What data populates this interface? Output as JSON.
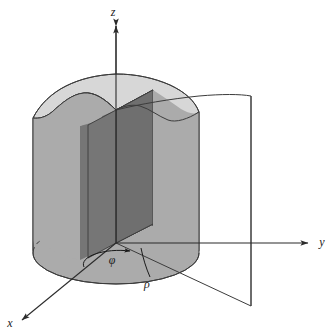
{
  "figure": {
    "background_color": "#ffffff"
  },
  "axes": {
    "z": {
      "label": "z",
      "label_x": 113,
      "label_y": 16,
      "name": "z-axis"
    },
    "y": {
      "label": "y",
      "label_x": 322,
      "label_y": 243,
      "name": "y-axis"
    },
    "x": {
      "label": "x",
      "label_x": 10,
      "label_y": 327,
      "name": "x-axis"
    }
  },
  "annotations": {
    "phi": {
      "label": "φ",
      "label_x": 112,
      "label_y": 264,
      "name": "azimuthal-angle-phi"
    },
    "rho": {
      "label": "ρ",
      "label_x": 146,
      "label_y": 285,
      "name": "radial-distance-rho"
    }
  },
  "colors": {
    "stroke": "#3c3c3c",
    "axis_stroke": "#2b2b2b",
    "cylinder_side": "#ababab",
    "cylinder_side_front": "#b0b0b0",
    "cylinder_cut_dark": "#6f6f6f",
    "cylinder_cut_darker": "#787878",
    "top_cap_light": "#d7d7d7",
    "top_cap_edge": "#c9c9c9",
    "base_fill": "#ababab",
    "halfplane_fill": "#ffffff",
    "label_color": "#1a1a1a"
  },
  "geometry": {
    "origin": {
      "x": 116,
      "y": 243
    },
    "cylinder": {
      "radius_x": 83,
      "radius_y": 31,
      "center_base_x": 116,
      "center_base_y": 253,
      "top_y_min": 57,
      "top_y_max": 112
    },
    "halfplane": {
      "near_edge_x": 116,
      "far_edge_x": 251,
      "top_y": 96,
      "bottom_y": 306
    }
  },
  "elements": [
    {
      "name": "cylinder-body",
      "description": "Vertical circular cylinder with irregular wavy top"
    },
    {
      "name": "cylinder-top-cap",
      "description": "Light gray irregular top surface"
    },
    {
      "name": "cylinder-cut-wedge",
      "description": "Dark gray cut-away wedge faces"
    },
    {
      "name": "cylinder-base-ellipse",
      "description": "Base disk in the xy-plane"
    },
    {
      "name": "base-hidden-arc",
      "description": "Dashed hidden rear arc of the base circle"
    },
    {
      "name": "halfplane",
      "description": "Vertical half-plane at constant phi"
    },
    {
      "name": "phi-arc",
      "description": "Arc with arrowhead indicating azimuthal angle"
    },
    {
      "name": "rho-leader",
      "description": "Leader line pointing to radial distance"
    }
  ]
}
